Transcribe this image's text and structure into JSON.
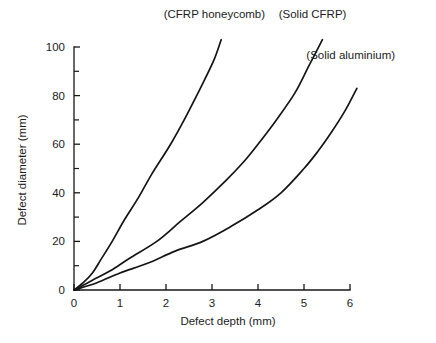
{
  "chart_data": {
    "type": "line",
    "title": "",
    "xlabel": "Defect depth   (mm)",
    "ylabel": "Defect diameter   (mm)",
    "xlim": [
      0,
      6
    ],
    "ylim": [
      0,
      106
    ],
    "xticks": [
      "0",
      "1",
      "2",
      "3",
      "4",
      "5",
      "6"
    ],
    "yticks": [
      "0",
      "20",
      "40",
      "60",
      "80",
      "100"
    ],
    "xtick_values": [
      0,
      1,
      2,
      3,
      4,
      5,
      6
    ],
    "ytick_values": [
      0,
      20,
      40,
      60,
      80,
      100
    ],
    "minor_ticks": "y-axis only, midway between major ticks",
    "grid": false,
    "legend": "inline curve annotations",
    "series": [
      {
        "name": "(CFRP honeycomb)",
        "label_x": 1.95,
        "label_y": 112,
        "points": [
          {
            "x": 0.0,
            "y": 0
          },
          {
            "x": 0.2,
            "y": 3
          },
          {
            "x": 0.4,
            "y": 7
          },
          {
            "x": 0.6,
            "y": 13
          },
          {
            "x": 0.83,
            "y": 20
          },
          {
            "x": 1.1,
            "y": 29
          },
          {
            "x": 1.4,
            "y": 38
          },
          {
            "x": 1.7,
            "y": 48
          },
          {
            "x": 2.1,
            "y": 60
          },
          {
            "x": 2.45,
            "y": 72
          },
          {
            "x": 2.8,
            "y": 85
          },
          {
            "x": 3.05,
            "y": 95
          },
          {
            "x": 3.2,
            "y": 103
          }
        ]
      },
      {
        "name": "(Solid CFRP)",
        "label_x": 4.45,
        "label_y": 112,
        "points": [
          {
            "x": 0.0,
            "y": 0
          },
          {
            "x": 0.4,
            "y": 4
          },
          {
            "x": 0.8,
            "y": 8
          },
          {
            "x": 1.2,
            "y": 13
          },
          {
            "x": 1.8,
            "y": 20
          },
          {
            "x": 2.3,
            "y": 28
          },
          {
            "x": 2.8,
            "y": 36
          },
          {
            "x": 3.3,
            "y": 45
          },
          {
            "x": 3.7,
            "y": 53
          },
          {
            "x": 4.0,
            "y": 60
          },
          {
            "x": 4.4,
            "y": 70
          },
          {
            "x": 4.8,
            "y": 81
          },
          {
            "x": 5.1,
            "y": 92
          },
          {
            "x": 5.4,
            "y": 103
          }
        ]
      },
      {
        "name": "(Solid aluminium)",
        "label_x": 5.05,
        "label_y": 95,
        "points": [
          {
            "x": 0.0,
            "y": 0
          },
          {
            "x": 0.5,
            "y": 3
          },
          {
            "x": 1.0,
            "y": 7
          },
          {
            "x": 1.6,
            "y": 11
          },
          {
            "x": 2.2,
            "y": 16
          },
          {
            "x": 2.8,
            "y": 20
          },
          {
            "x": 3.4,
            "y": 26
          },
          {
            "x": 4.0,
            "y": 33
          },
          {
            "x": 4.5,
            "y": 40
          },
          {
            "x": 5.0,
            "y": 50
          },
          {
            "x": 5.3,
            "y": 57
          },
          {
            "x": 5.6,
            "y": 65
          },
          {
            "x": 5.9,
            "y": 74
          },
          {
            "x": 6.15,
            "y": 83
          }
        ]
      }
    ]
  },
  "axes": {
    "x_label": "Defect depth   (mm)",
    "y_label": "Defect diameter   (mm)"
  }
}
